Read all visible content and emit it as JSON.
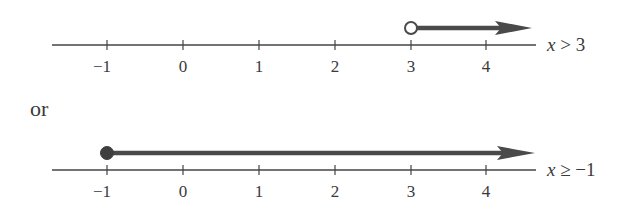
{
  "diagram": {
    "type": "number_line_pair",
    "connector_text": "or",
    "colors": {
      "axis": "#444444",
      "ray": "#4a4a4a",
      "text": "#3a3a3a"
    },
    "number_lines": [
      {
        "id": "top",
        "ticks": [
          "−1",
          "0",
          "1",
          "2",
          "3",
          "4"
        ],
        "endpoint": {
          "value": 3,
          "style": "open-circle"
        },
        "direction": "right",
        "label_var": "x",
        "label_rest": " > 3",
        "label": "x > 3"
      },
      {
        "id": "bottom",
        "ticks": [
          "−1",
          "0",
          "1",
          "2",
          "3",
          "4"
        ],
        "endpoint": {
          "value": -1,
          "style": "closed-circle"
        },
        "direction": "right",
        "label_var": "x",
        "label_rest": " ≥ −1",
        "label": "x ≥ −1"
      }
    ]
  }
}
